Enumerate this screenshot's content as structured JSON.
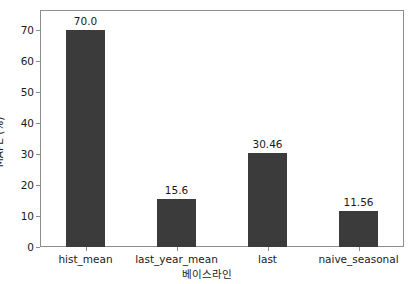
{
  "chart_data": {
    "type": "bar",
    "title": "",
    "xlabel": "베이스라인",
    "ylabel": "MAPE (%)",
    "categories": [
      "hist_mean",
      "last_year_mean",
      "last",
      "naive_seasonal"
    ],
    "values": [
      70.0,
      15.6,
      30.46,
      11.56
    ],
    "data_labels": [
      "70.0",
      "15.6",
      "30.46",
      "11.56"
    ],
    "ylim": [
      0,
      76.5
    ],
    "yticks": [
      0,
      10,
      20,
      30,
      40,
      50,
      60,
      70
    ],
    "ytick_labels": [
      "0",
      "10",
      "20",
      "30",
      "40",
      "50",
      "60",
      "70"
    ],
    "grid": false,
    "legend": null,
    "bar_color": "#3b3b3b",
    "axes_color": "#8d8d8d",
    "background_color": "#ffffff",
    "text_color": "#1a1a1a"
  }
}
